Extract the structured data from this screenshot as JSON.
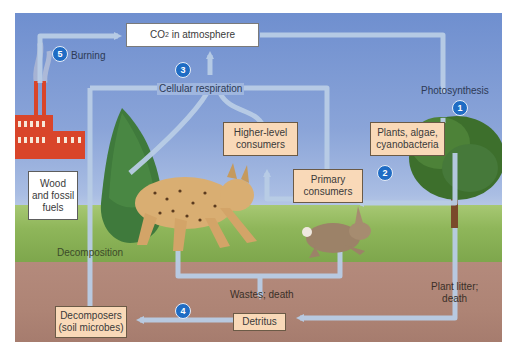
{
  "diagram": {
    "nodes": {
      "co2_atmosphere": {
        "label": "CO",
        "sub": "2",
        "rest": " in atmosphere"
      },
      "plants": {
        "label": "Plants, algae,\ncyanobacteria"
      },
      "higher_consumers": {
        "label": "Higher-level\nconsumers"
      },
      "primary_consumers": {
        "label": "Primary\nconsumers"
      },
      "wood_fossil": {
        "label": "Wood\nand fossil\nfuels"
      },
      "decomposers": {
        "label": "Decomposers\n(soil microbes)"
      },
      "detritus": {
        "label": "Detritus"
      }
    },
    "process_labels": {
      "burning": "Burning",
      "cellular_respiration": "Cellular respiration",
      "photosynthesis": "Photosynthesis",
      "decomposition": "Decomposition",
      "wastes_death": "Wastes; death",
      "plant_litter": "Plant litter;\ndeath"
    },
    "steps": [
      {
        "n": "1",
        "process": "Photosynthesis"
      },
      {
        "n": "2",
        "process": "Plants to primary consumers"
      },
      {
        "n": "3",
        "process": "Cellular respiration"
      },
      {
        "n": "4",
        "process": "Detritus to decomposers"
      },
      {
        "n": "5",
        "process": "Burning"
      }
    ],
    "colors": {
      "sky_top": "#6f8fcf",
      "arrow": "#b9cde6",
      "box_fill": "#f9d9b8",
      "badge": "#1f6cc4",
      "grass": "#8fb65a",
      "soil": "#ae8475",
      "factory": "#d9452a"
    }
  }
}
